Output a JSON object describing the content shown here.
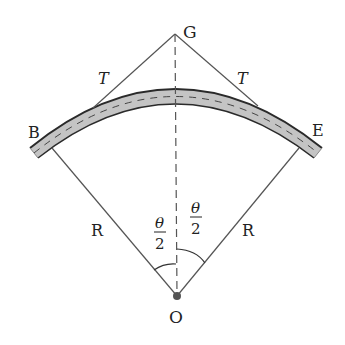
{
  "diagram": {
    "labels": {
      "apex": "G",
      "tangent_left": "T",
      "tangent_right": "T",
      "begin": "B",
      "end": "E",
      "radius_left": "R",
      "radius_right": "R",
      "center": "O",
      "angle_numerator_left": "θ",
      "angle_denominator_left": "2",
      "angle_numerator_right": "θ",
      "angle_denominator_right": "2"
    },
    "colors": {
      "line": "#555555",
      "road_fill": "#bdbdbd",
      "road_edge": "#333333",
      "text": "#222222",
      "background": "#ffffff"
    }
  }
}
